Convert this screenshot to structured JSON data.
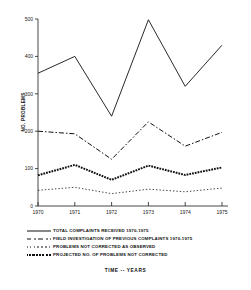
{
  "chart_data": {
    "type": "line",
    "title": "",
    "xlabel": "TIME -- YEARS",
    "ylabel": "NO. PROBLEMS",
    "x": [
      1970,
      1971,
      1972,
      1973,
      1974,
      1975
    ],
    "xtick_labels": [
      "1970",
      "1971",
      "1972",
      "1973",
      "1974",
      "1975"
    ],
    "ytick_labels": [
      "0",
      "100",
      "200",
      "300",
      "400",
      "500"
    ],
    "yticks": [
      0,
      100,
      200,
      300,
      400,
      500
    ],
    "ylim": [
      0,
      500
    ],
    "xlim": [
      1970,
      1975
    ],
    "grid": false,
    "legend_position": "below-plot-left",
    "series": [
      {
        "name": "TOTAL COMPLAINTS RECEIVED 1970-1975",
        "style": "solid",
        "values": [
          355,
          400,
          240,
          498,
          320,
          430
        ]
      },
      {
        "name": "FIELD INVESTIGATION OF PREVIOUS COMPLAINTS 1970-1975",
        "style": "dash-dot",
        "values": [
          200,
          193,
          125,
          225,
          160,
          197
        ]
      },
      {
        "name": "PROBLEMS NOT CORRECTED AS OBSERVED",
        "style": "dotted",
        "values": [
          42,
          50,
          33,
          45,
          38,
          48
        ]
      },
      {
        "name": "PROJECTED NO. OF PROBLEMS NOT CORRECTED",
        "style": "beaded",
        "values": [
          82,
          110,
          70,
          108,
          83,
          103
        ]
      }
    ]
  },
  "legend": {
    "items": [
      {
        "label": "TOTAL COMPLAINTS RECEIVED 1970-1975",
        "style": "solid"
      },
      {
        "label": "FIELD INVESTIGATION OF PREVIOUS COMPLAINTS 1970-1975",
        "style": "dash-dot"
      },
      {
        "label": "PROBLEMS NOT CORRECTED AS OBSERVED",
        "style": "dotted"
      },
      {
        "label": "PROJECTED NO. OF PROBLEMS NOT CORRECTED",
        "style": "beaded"
      }
    ]
  },
  "axes": {
    "y_title": "NO. PROBLEMS",
    "x_title": "TIME -- YEARS"
  }
}
